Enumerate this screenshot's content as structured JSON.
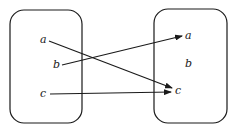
{
  "diagram": {
    "type": "function-mapping",
    "colors": {
      "stroke": "#1a1a1a",
      "background": "#ffffff"
    },
    "domain_set": {
      "elements": [
        {
          "id": "a",
          "label": "a"
        },
        {
          "id": "b",
          "label": "b"
        },
        {
          "id": "c",
          "label": "c"
        }
      ]
    },
    "codomain_set": {
      "elements": [
        {
          "id": "a",
          "label": "a"
        },
        {
          "id": "b",
          "label": "b"
        },
        {
          "id": "c",
          "label": "c"
        }
      ]
    },
    "mappings": [
      {
        "from": "a",
        "to": "c"
      },
      {
        "from": "b",
        "to": "a"
      },
      {
        "from": "c",
        "to": "c"
      }
    ]
  }
}
